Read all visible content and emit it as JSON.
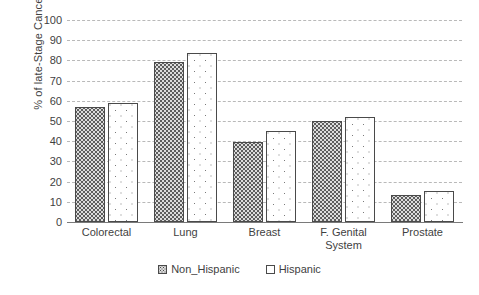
{
  "chart_data": {
    "type": "bar",
    "title": "",
    "subtitle": "",
    "xlabel": "",
    "ylabel": "% of late-Stage Cancers",
    "ylim": [
      0,
      100
    ],
    "ytick_step": 10,
    "yticks": [
      "100",
      "90",
      "80",
      "70",
      "60",
      "50",
      "40",
      "30",
      "20",
      "10",
      "0"
    ],
    "grid": "horizontal-dashed",
    "legend_position": "bottom-center",
    "categories": [
      "Colorectal",
      "Lung",
      "Breast",
      "F. Genital System",
      "Prostate"
    ],
    "category_lines": [
      [
        "Colorectal"
      ],
      [
        "Lung"
      ],
      [
        "Breast"
      ],
      [
        "F. Genital",
        "System"
      ],
      [
        "Prostate"
      ]
    ],
    "series": [
      {
        "name": "Non_Hispanic",
        "pattern": "dense-dotted-gray",
        "values": [
          57,
          79,
          39.5,
          50,
          13.5
        ]
      },
      {
        "name": "Hispanic",
        "pattern": "sparse-dotted-white",
        "values": [
          59,
          83.5,
          45,
          52,
          15.5
        ]
      }
    ]
  },
  "legend": {
    "items": [
      {
        "label": "Non_Hispanic",
        "swatch": "dense-dotted-swatch"
      },
      {
        "label": "Hispanic",
        "swatch": "open-square-swatch"
      }
    ]
  },
  "colors": {
    "axis": "#7a7a7a",
    "gridline": "#b9b9b9",
    "bar_outline": "#4a4a4a",
    "series_0_fill": "#dcdcdc",
    "series_1_fill": "#ffffff",
    "text": "#3f3f3f",
    "background": "#ffffff"
  }
}
